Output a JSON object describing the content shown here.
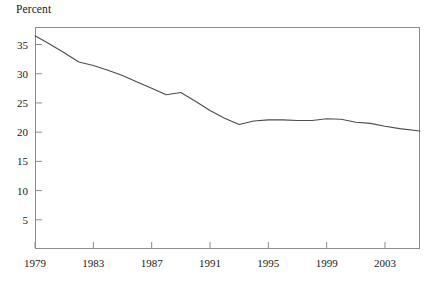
{
  "chart_data": {
    "type": "line",
    "title": "",
    "ylabel": "Percent",
    "xlabel": "",
    "ylim": [
      0,
      38
    ],
    "xlim": [
      1979,
      2005.4
    ],
    "yticks": [
      5,
      10,
      15,
      20,
      25,
      30,
      35
    ],
    "ytick_labels": [
      "5",
      "10",
      "15",
      "20",
      "25",
      "30",
      "35"
    ],
    "xticks": [
      1979,
      1983,
      1987,
      1991,
      1995,
      1999,
      2003
    ],
    "xtick_labels": [
      "1979",
      "1983",
      "1987",
      "1991",
      "1995",
      "1999",
      "2003"
    ],
    "grid": false,
    "legend": null,
    "series": [
      {
        "name": "Percent",
        "color": "#4d4d4d",
        "x": [
          1979,
          1980,
          1981,
          1982,
          1983,
          1984,
          1985,
          1986,
          1987,
          1988,
          1989,
          1990,
          1991,
          1992,
          1993,
          1994,
          1995,
          1996,
          1997,
          1998,
          1999,
          2000,
          2001,
          2002,
          2003,
          2004,
          2005.4
        ],
        "values": [
          36.5,
          35.1,
          33.6,
          32.0,
          31.4,
          30.6,
          29.7,
          28.6,
          27.5,
          26.4,
          26.8,
          25.3,
          23.7,
          22.4,
          21.3,
          21.9,
          22.1,
          22.1,
          22.0,
          22.0,
          22.3,
          22.2,
          21.7,
          21.5,
          21.0,
          20.6,
          20.2
        ]
      }
    ]
  },
  "plot": {
    "frame_color": "#8d8d8d",
    "left": 35,
    "top": 27,
    "right": 420,
    "bottom": 249,
    "y_value_at_top": 38.0,
    "y_value_at_bottom": 0.0,
    "x_value_at_left": 1979,
    "x_value_at_right": 2005.4
  }
}
